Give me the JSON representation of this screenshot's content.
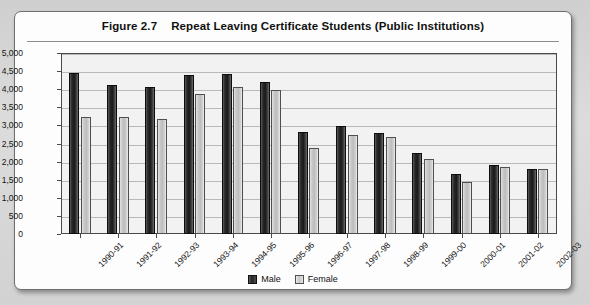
{
  "figure": {
    "number": "Figure 2.7",
    "title": "Repeat Leaving Certificate Students (Public Institutions)"
  },
  "legend": {
    "male_label": "Male",
    "female_label": "Female"
  },
  "chart_data": {
    "type": "bar",
    "xlabel": "",
    "ylabel": "",
    "ylim": [
      0,
      5000
    ],
    "ytick_labels": [
      "0",
      "500",
      "1,000",
      "1,500",
      "2,000",
      "2,500",
      "3,000",
      "3,500",
      "4,000",
      "4,500",
      "5,000"
    ],
    "ytick_values": [
      0,
      500,
      1000,
      1500,
      2000,
      2500,
      3000,
      3500,
      4000,
      4500,
      5000
    ],
    "grid": true,
    "legend_position": "bottom-center",
    "categories": [
      "1990-91",
      "1991-92",
      "1992-93",
      "1993-94",
      "1994-95",
      "1995-96",
      "1996-97",
      "1997-98",
      "1998-99",
      "1999-00",
      "2000-01",
      "2001-02",
      "2002-03"
    ],
    "series": [
      {
        "name": "Male",
        "color": "#1f1f1f",
        "values": [
          4450,
          4110,
          4050,
          4400,
          4420,
          4200,
          2820,
          2980,
          2800,
          2250,
          1650,
          1900,
          1800
        ]
      },
      {
        "name": "Female",
        "color": "#c8c8c8",
        "values": [
          3220,
          3220,
          3180,
          3880,
          4060,
          3980,
          2380,
          2740,
          2680,
          2060,
          1430,
          1840,
          1800
        ]
      }
    ]
  }
}
